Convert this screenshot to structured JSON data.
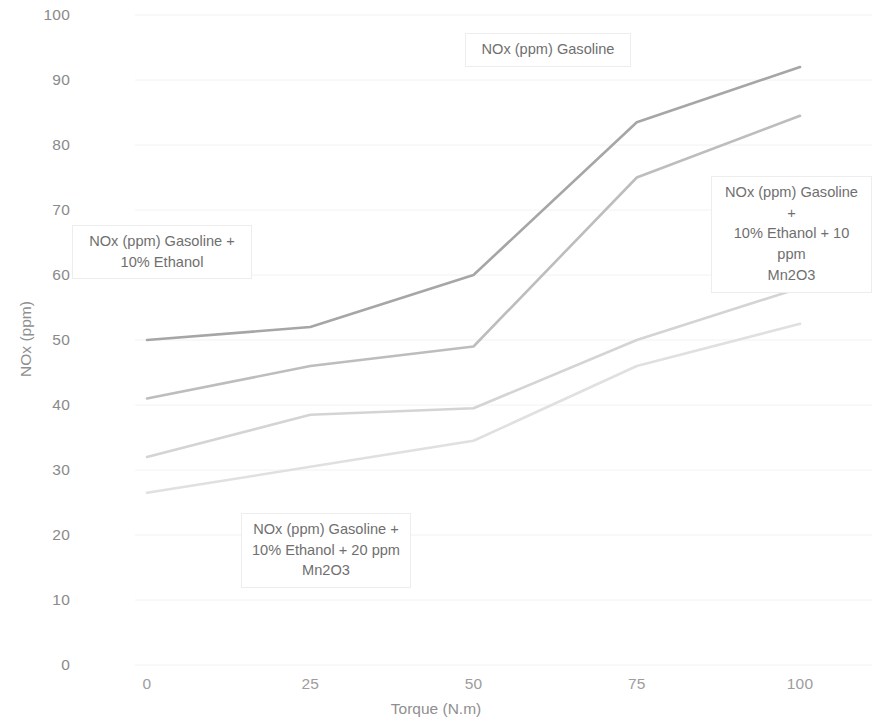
{
  "axes": {
    "x": {
      "title": "Torque (N.m)",
      "ticks": [
        "0",
        "25",
        "50",
        "75",
        "100"
      ],
      "min": 0,
      "max": 100
    },
    "y": {
      "title": "NOx (ppm)",
      "ticks": [
        "0",
        "10",
        "20",
        "30",
        "40",
        "50",
        "60",
        "70",
        "80",
        "90",
        "100"
      ],
      "min": 0,
      "max": 100
    }
  },
  "callouts": {
    "gasoline": "NOx (ppm)   Gasoline",
    "ethanol10": "NOx (ppm)   Gasoline +\n10% Ethanol",
    "ethanol10_mn10": "NOx (ppm)   Gasoline +\n10% Ethanol + 10 ppm\nMn2O3",
    "ethanol10_mn20": "NOx (ppm)   Gasoline +\n10% Ethanol + 20 ppm\nMn2O3"
  },
  "colors": {
    "series_gasoline": "#a6a6a6",
    "series_ethanol10": "#bdbdbd",
    "series_mn10": "#d4d4d4",
    "series_mn20": "#e0e0e0",
    "gridline": "#f2f2f2",
    "tick_label": "#8f8f8f"
  },
  "chart_data": {
    "type": "line",
    "title": "",
    "xlabel": "Torque (N.m)",
    "ylabel": "NOx (ppm)",
    "xlim": [
      0,
      100
    ],
    "ylim": [
      0,
      100
    ],
    "grid": false,
    "legend": "callout-labels-on-plot",
    "x": [
      0,
      25,
      50,
      75,
      100
    ],
    "series": [
      {
        "name": "NOx (ppm)   Gasoline",
        "color": "#a6a6a6",
        "values": [
          50,
          52,
          60,
          83.5,
          92
        ]
      },
      {
        "name": "NOx (ppm)   Gasoline + 10% Ethanol",
        "color": "#bdbdbd",
        "values": [
          41,
          46,
          49,
          75,
          84.5
        ]
      },
      {
        "name": "NOx (ppm)   Gasoline + 10% Ethanol + 10 ppm Mn2O3",
        "color": "#d4d4d4",
        "values": [
          32,
          38.5,
          39.5,
          50,
          58
        ]
      },
      {
        "name": "NOx (ppm)   Gasoline + 10% Ethanol + 20 ppm Mn2O3",
        "color": "#e0e0e0",
        "values": [
          26.5,
          30.5,
          34.5,
          46,
          52.5
        ]
      }
    ]
  }
}
